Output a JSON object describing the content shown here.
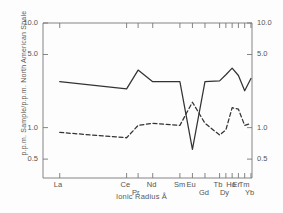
{
  "chart_data": {
    "type": "line",
    "title": "",
    "xlabel": "Ionic Radius Å",
    "ylabel": "p.p.m. Sample/p.p.m. North American Shale",
    "yscale": "log",
    "ylim": [
      0.33,
      10.0
    ],
    "grid": false,
    "legend": "none",
    "y_ticks": [
      "10.0",
      "5.0",
      "1.0",
      "0.5"
    ],
    "y_tick_values": [
      10.0,
      5.0,
      1.0,
      0.5
    ],
    "y_ticks_right": [
      "10.0",
      "5.0",
      "1.0",
      "0.5"
    ],
    "categories": [
      "La",
      "Ce",
      "Pr",
      "Nd",
      "Sm",
      "Eu",
      "Gd",
      "Tb",
      "Dy",
      "Ho",
      "Er",
      "Tm",
      "Yb"
    ],
    "category_label_row": [
      "upper",
      "upper",
      "lower",
      "upper",
      "upper",
      "upper",
      "lower",
      "upper",
      "lower",
      "upper",
      "upper",
      "upper",
      "lower"
    ],
    "x_positions": [
      0.08,
      0.4,
      0.455,
      0.525,
      0.655,
      0.715,
      0.775,
      0.845,
      0.875,
      0.905,
      0.935,
      0.965,
      0.995
    ],
    "series": [
      {
        "name": "solid-curve",
        "style": "solid",
        "color": "#333333",
        "values": [
          2.75,
          2.35,
          3.55,
          2.75,
          2.75,
          0.62,
          2.75,
          2.8,
          3.2,
          3.7,
          3.15,
          2.25,
          2.95
        ]
      },
      {
        "name": "dashed-curve",
        "style": "dashed",
        "color": "#333333",
        "values": [
          0.9,
          0.8,
          1.05,
          1.1,
          1.05,
          1.75,
          1.1,
          0.85,
          0.95,
          1.55,
          1.5,
          1.05,
          1.1
        ]
      }
    ]
  },
  "axes": {
    "y_left_label": "p.p.m. Sample/p.p.m. North American Shale",
    "x_axis_label": "Ionic Radius Å",
    "ticks_left": [
      "10.0",
      "5.0",
      "1.0",
      "0.5"
    ],
    "ticks_right": [
      "10.0",
      "5.0",
      "1.0",
      "0.5"
    ],
    "element_labels": [
      "La",
      "Ce",
      "Pr",
      "Nd",
      "Sm",
      "Eu",
      "Gd",
      "Tb",
      "Dy",
      "Ho",
      "Er",
      "Tm",
      "Yb"
    ]
  }
}
